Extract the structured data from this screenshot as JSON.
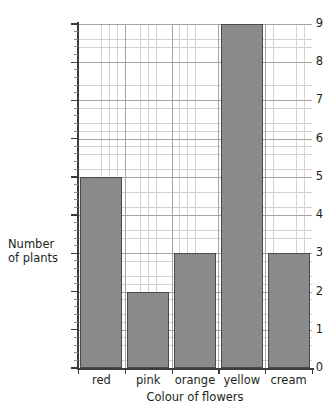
{
  "chart_data": {
    "type": "bar",
    "title": "",
    "subtitle": "",
    "xlabel": "Colour of flowers",
    "ylabel": "Number of plants",
    "ylabel_line1": "Number",
    "ylabel_line2": "of plants",
    "categories": [
      "red",
      "pink",
      "orange",
      "yellow",
      "cream"
    ],
    "values": [
      5,
      2,
      3,
      9,
      3
    ],
    "ylim": [
      0,
      9
    ],
    "y_ticks": [
      0,
      1,
      2,
      3,
      4,
      5,
      6,
      7,
      8,
      9
    ],
    "y_tick_labels": [
      "0",
      "1",
      "2",
      "3",
      "4",
      "5",
      "6",
      "7",
      "8",
      "9"
    ],
    "y_minor_divisions": 5,
    "grid": true,
    "grid_style": "graph-paper",
    "legend": "none",
    "bar_fill_color": "#8a8a8a",
    "bar_border_color": "#4a4a4a",
    "major_grid_color": "#a9a2a2",
    "minor_grid_color": "#d9cfcf",
    "axis_color": "#3b3b3b",
    "text_color": "#231f20",
    "background_color": "#ffffff"
  }
}
